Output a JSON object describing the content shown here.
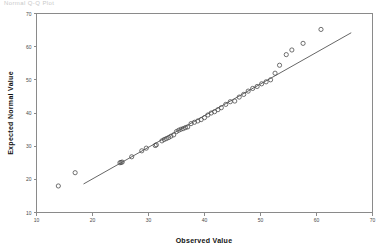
{
  "title": "Normal Q-Q Plot",
  "chart_data": {
    "type": "scatter",
    "title": "Normal Q-Q Plot",
    "xlabel": "Observed Value",
    "ylabel": "Expected Normal Value",
    "xlim": [
      10,
      70
    ],
    "ylim": [
      10,
      70
    ],
    "xticks": [
      10,
      20,
      30,
      40,
      50,
      60,
      70
    ],
    "yticks": [
      10,
      20,
      30,
      40,
      50,
      60,
      70
    ],
    "grid": false,
    "legend": null,
    "marker": "open-circle",
    "series": [
      {
        "name": "Expected Normal Value",
        "x": [
          13.9,
          16.9,
          24.9,
          25.1,
          25.3,
          27.0,
          28.8,
          29.6,
          31.2,
          31.4,
          32.4,
          32.8,
          33.2,
          33.6,
          34.0,
          34.5,
          35.0,
          35.4,
          35.8,
          36.2,
          36.6,
          37.0,
          37.6,
          38.2,
          38.8,
          39.4,
          40.0,
          40.6,
          41.2,
          41.8,
          42.4,
          43.0,
          43.8,
          44.6,
          45.4,
          46.2,
          47.0,
          47.8,
          48.6,
          49.4,
          50.2,
          51.0,
          51.8,
          52.6,
          53.4,
          54.6,
          55.6,
          57.6,
          60.8
        ],
        "y": [
          18.0,
          22.0,
          25.0,
          25.1,
          25.2,
          26.8,
          28.6,
          29.4,
          30.2,
          30.4,
          31.6,
          32.0,
          32.3,
          32.6,
          33.0,
          33.4,
          34.4,
          34.8,
          35.1,
          35.3,
          35.6,
          35.8,
          36.8,
          37.2,
          37.6,
          38.0,
          38.6,
          39.4,
          40.0,
          40.4,
          41.0,
          41.6,
          42.6,
          43.4,
          43.6,
          44.8,
          45.6,
          46.6,
          47.4,
          48.0,
          48.8,
          49.4,
          50.0,
          52.0,
          54.4,
          57.6,
          59.0,
          61.0,
          65.2
        ]
      }
    ],
    "reference_line": {
      "name": "expected-normal-reference-line",
      "x": [
        18.4,
        66.2
      ],
      "y": [
        18.6,
        64.2
      ]
    }
  },
  "axes": {
    "x": {
      "title": "Observed Value",
      "ticks": [
        "10",
        "20",
        "30",
        "40",
        "50",
        "60",
        "70"
      ]
    },
    "y": {
      "title": "Expected Normal Value",
      "ticks": [
        "70",
        "60",
        "50",
        "40",
        "30",
        "20",
        "10"
      ]
    }
  }
}
